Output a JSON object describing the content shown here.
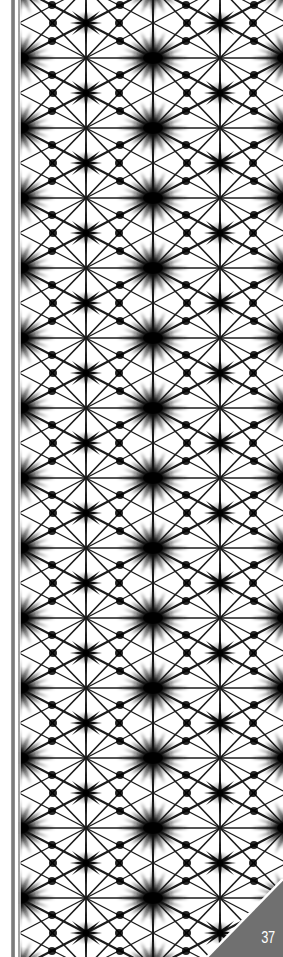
{
  "page": {
    "type": "book-page-decorative-pattern",
    "pattern_name": "shibori-star-grid",
    "page_number": "37",
    "colors": {
      "background": "#ffffff",
      "ink": "#111111",
      "spine_bar": "#7a7a7a",
      "corner_tab": "#707070",
      "page_number_text": "#ffffff"
    }
  }
}
